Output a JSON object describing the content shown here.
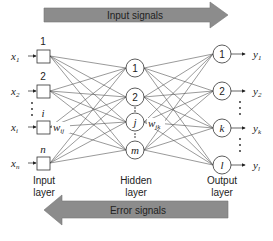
{
  "diagram": {
    "top_arrow": {
      "label": "Input signals",
      "direction": "right",
      "color": "#8c8c8c"
    },
    "bottom_arrow": {
      "label": "Error signals",
      "direction": "left",
      "color": "#8c8c8c"
    },
    "layers": [
      {
        "name": "Input layer",
        "line1": "Input",
        "line2": "layer",
        "nodes": [
          {
            "label": "1",
            "input": "x",
            "input_sub": "1"
          },
          {
            "label": "2",
            "input": "x",
            "input_sub": "2"
          },
          {
            "label": "i",
            "input": "x",
            "input_sub": "i"
          },
          {
            "label": "n",
            "input": "x",
            "input_sub": "n"
          }
        ]
      },
      {
        "name": "Hidden layer",
        "line1": "Hidden",
        "line2": "layer",
        "nodes": [
          {
            "label": "1"
          },
          {
            "label": "2"
          },
          {
            "label": "j"
          },
          {
            "label": "m"
          }
        ]
      },
      {
        "name": "Output layer",
        "line1": "Output",
        "line2": "layer",
        "nodes": [
          {
            "label": "1",
            "output": "y",
            "output_sub": "1"
          },
          {
            "label": "2",
            "output": "y",
            "output_sub": "2"
          },
          {
            "label": "k",
            "output": "y",
            "output_sub": "k"
          },
          {
            "label": "l",
            "output": "y",
            "output_sub": "l"
          }
        ]
      }
    ],
    "weights": {
      "input_hidden": {
        "w": "w",
        "sub": "ij"
      },
      "hidden_output": {
        "w": "w",
        "sub": "jk"
      }
    }
  }
}
